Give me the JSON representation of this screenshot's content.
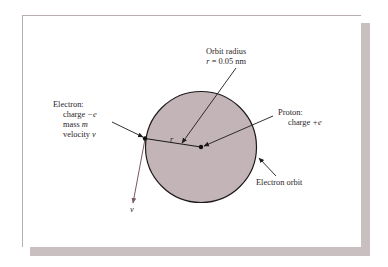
{
  "figure": {
    "type": "Bohr hydrogen atom model",
    "orbit_radius_label": {
      "line1": "Orbit radius",
      "line2_var": "r",
      "line2_rest": " = 0.05 nm"
    },
    "electron_label": {
      "title": "Electron:",
      "charge_text": "charge ",
      "charge_value": "−e",
      "mass_text": "mass ",
      "mass_value": "m",
      "velocity_text": "velocity ",
      "velocity_value": "v"
    },
    "proton_label": {
      "title": "Proton:",
      "charge_text": "charge ",
      "charge_value": "+e"
    },
    "orbit_label": "Electron orbit",
    "radius_symbol": "r",
    "velocity_symbol": "v",
    "colors": {
      "orbit_fill": "#c3b5b7",
      "line": "#1e1a1b",
      "velocity_vector": "#7a5a5c",
      "card_shadow": "#c9bec0"
    }
  }
}
